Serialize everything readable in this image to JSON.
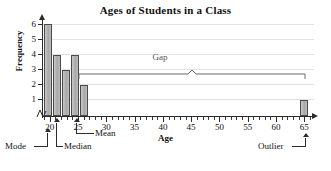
{
  "chart_data": {
    "type": "bar",
    "title": "Ages of Students in a Class",
    "xlabel": "Age",
    "ylabel": "Frequency",
    "categories": [
      20,
      21,
      22,
      23,
      24,
      65
    ],
    "values": [
      6,
      4,
      3,
      4,
      2,
      1
    ],
    "xlim": [
      19,
      66
    ],
    "ylim": [
      0,
      6
    ],
    "x_ticks_major": [
      20,
      25,
      30,
      35,
      40,
      45,
      50,
      55,
      60,
      65
    ],
    "x_tick_interval_minor": 1,
    "y_ticks": [
      1,
      2,
      3,
      4,
      5,
      6
    ],
    "grid": true,
    "legend": "none",
    "axis_break": true,
    "bar_color": "#b4b4b4",
    "bar_edge_color": "#4a4a4a",
    "annotations": [
      {
        "label": "Gap",
        "type": "bracket",
        "from": 25,
        "to": 64
      },
      {
        "label": "Mode",
        "type": "pointer",
        "at": 20
      },
      {
        "label": "Median",
        "type": "pointer",
        "at": 21.5
      },
      {
        "label": "Mean",
        "type": "pointer",
        "at": 25
      },
      {
        "label": "Outlier",
        "type": "pointer",
        "at": 65
      }
    ]
  },
  "axes": {
    "y_labels": [
      "6",
      "5",
      "4",
      "3",
      "2",
      "1"
    ],
    "x_labels": [
      "20",
      "25",
      "30",
      "35",
      "40",
      "45",
      "50",
      "55",
      "60",
      "65"
    ],
    "y_title": "Frequency",
    "x_title": "Age"
  },
  "labels": {
    "title": "Ages of Students in a Class",
    "gap": "Gap",
    "mode": "Mode",
    "median": "Median",
    "mean": "Mean",
    "outlier": "Outlier"
  }
}
